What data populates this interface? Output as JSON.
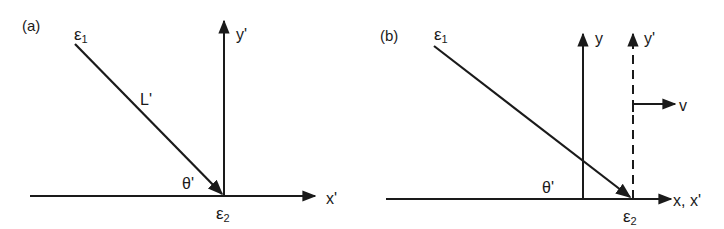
{
  "panels": [
    {
      "id": "a",
      "label": "(a)",
      "event_start": {
        "symbol": "ε",
        "subscript": "1"
      },
      "event_end": {
        "symbol": "ε",
        "subscript": "2"
      },
      "line_label": "L'",
      "angle_label": "θ'",
      "x_axis_label": "x'",
      "y_axis_label": "y'"
    },
    {
      "id": "b",
      "label": "(b)",
      "event_start": {
        "symbol": "ε",
        "subscript": "1"
      },
      "event_end": {
        "symbol": "ε",
        "subscript": "2"
      },
      "angle_label": "θ'",
      "x_axis_label": "x, x'",
      "y_axis_label": "y",
      "y_prime_axis_label": "y'",
      "velocity_label": "v"
    }
  ],
  "colors": {
    "ink": "#1a1a1a",
    "background": "#ffffff"
  }
}
